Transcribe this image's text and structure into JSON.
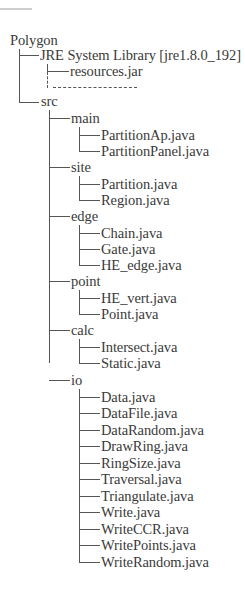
{
  "root": "Polygon",
  "jre": {
    "label": "JRE System Library [jre1.8.0_192]",
    "children": [
      "resources.jar"
    ]
  },
  "src": {
    "label": "src",
    "packages": [
      {
        "name": "main",
        "files": [
          "PartitionAp.java",
          "PartitionPanel.java"
        ]
      },
      {
        "name": "site",
        "files": [
          "Partition.java",
          "Region.java"
        ]
      },
      {
        "name": "edge",
        "files": [
          "Chain.java",
          "Gate.java",
          "HE_edge.java"
        ]
      },
      {
        "name": "point",
        "files": [
          "HE_vert.java",
          "Point.java"
        ]
      },
      {
        "name": "calc",
        "files": [
          "Intersect.java",
          "Static.java"
        ]
      },
      {
        "name": "io",
        "files": [
          "Data.java",
          "DataFile.java",
          "DataRandom.java",
          "DrawRing.java",
          "RingSize.java",
          "Traversal.java",
          "Triangulate.java",
          "Write.java",
          "WriteCCR.java",
          "WritePoints.java",
          "WriteRandom.java"
        ]
      }
    ]
  },
  "colors": {
    "text": "#3a3a3a",
    "line": "#555555"
  }
}
